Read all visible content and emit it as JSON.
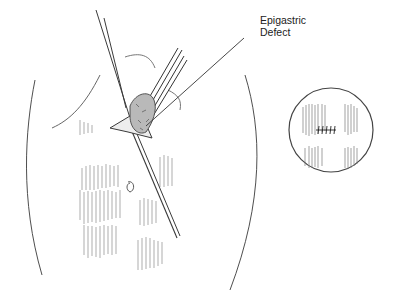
{
  "figure": {
    "callout": {
      "line1": "Epigastric",
      "line2": "Defect"
    },
    "inset": {
      "description": "circular inset showing sutured closure"
    },
    "colors": {
      "ink": "#3a3a3a",
      "light_ink": "#8a8a8a",
      "background": "#ffffff"
    }
  }
}
